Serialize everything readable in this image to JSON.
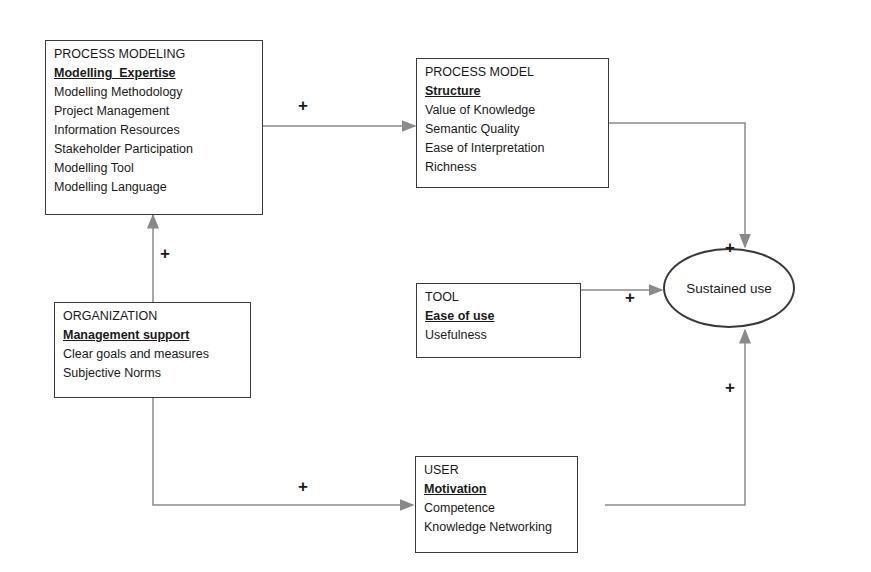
{
  "diagram": {
    "nodes": {
      "process_modeling": {
        "title": "PROCESS MODELING",
        "key": "Modelling  Expertise",
        "items": [
          "Modelling Methodology",
          "Project Management",
          "Information Resources",
          "Stakeholder Participation",
          "Modelling Tool",
          "Modelling Language"
        ]
      },
      "process_model": {
        "title": "PROCESS MODEL",
        "key": "Structure",
        "items": [
          "Value of Knowledge",
          "Semantic Quality",
          "Ease of Interpretation",
          "Richness"
        ]
      },
      "organization": {
        "title": "ORGANIZATION",
        "key": "Management support",
        "items": [
          "Clear goals and measures",
          "Subjective Norms"
        ]
      },
      "tool": {
        "title": "TOOL",
        "key": "Ease of use",
        "items": [
          "Usefulness"
        ]
      },
      "user": {
        "title": "USER",
        "key": "Motivation",
        "items": [
          "Competence",
          "Knowledge Networking"
        ]
      },
      "outcome": {
        "label": "Sustained use"
      }
    },
    "edges": [
      {
        "from": "process_modeling",
        "to": "process_model",
        "sign": "+"
      },
      {
        "from": "organization",
        "to": "process_modeling",
        "sign": "+"
      },
      {
        "from": "organization",
        "to": "user",
        "sign": "+"
      },
      {
        "from": "process_model",
        "to": "outcome",
        "sign": "+"
      },
      {
        "from": "tool",
        "to": "outcome",
        "sign": "+"
      },
      {
        "from": "user",
        "to": "outcome",
        "sign": "+"
      }
    ],
    "colors": {
      "line": "#8a8a8a",
      "border": "#3a3a3a",
      "text": "#1a1a1a"
    }
  }
}
